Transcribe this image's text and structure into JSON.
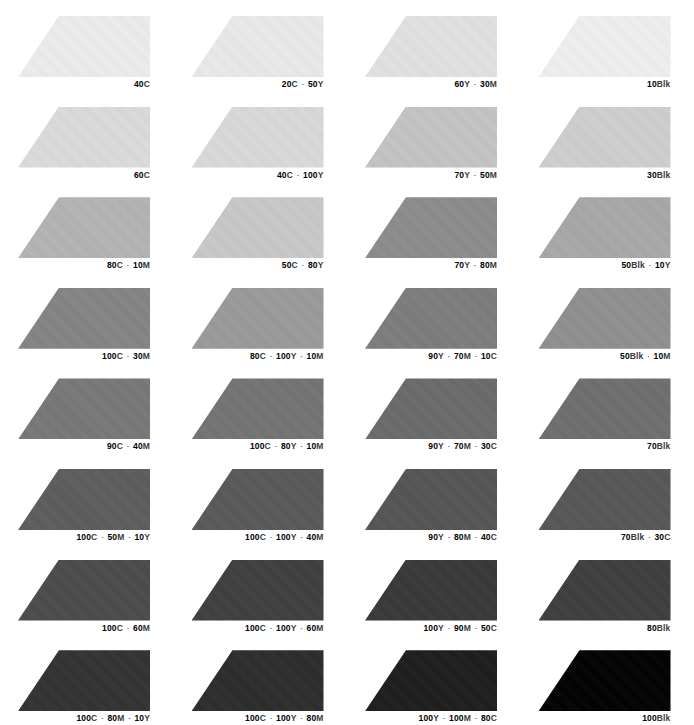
{
  "document": {
    "title": "Process Color Tint Chart",
    "separator": "·",
    "background_color": "#ffffff",
    "label_color": "#000000",
    "columns": 4,
    "rows": 8
  },
  "chart_data": {
    "type": "table",
    "xlabel": "",
    "ylabel": "",
    "legend": [],
    "grid": false,
    "categories": [
      "Column 1",
      "Column 2",
      "Column 3",
      "Column 4"
    ],
    "series": [
      {
        "name": "Row 1",
        "values": [
          {
            "label": "40C",
            "parts": [
              "40C"
            ],
            "swatch_color": "#ededed"
          },
          {
            "label": "20C · 50Y",
            "parts": [
              "20C",
              "50Y"
            ],
            "swatch_color": "#eaeaea"
          },
          {
            "label": "60Y · 30M",
            "parts": [
              "60Y",
              "30M"
            ],
            "swatch_color": "#e2e2e2"
          },
          {
            "label": "10Blk",
            "parts": [
              "10Blk"
            ],
            "swatch_color": "#f0f0f0"
          }
        ]
      },
      {
        "name": "Row 2",
        "values": [
          {
            "label": "60C",
            "parts": [
              "60C"
            ],
            "swatch_color": "#dcdcdc"
          },
          {
            "label": "40C · 100Y",
            "parts": [
              "40C",
              "100Y"
            ],
            "swatch_color": "#dadada"
          },
          {
            "label": "70Y · 50M",
            "parts": [
              "70Y",
              "50M"
            ],
            "swatch_color": "#c4c4c4"
          },
          {
            "label": "30Blk",
            "parts": [
              "30Blk"
            ],
            "swatch_color": "#cfcfcf"
          }
        ]
      },
      {
        "name": "Row 3",
        "values": [
          {
            "label": "80C · 10M",
            "parts": [
              "80C",
              "10M"
            ],
            "swatch_color": "#b4b4b4"
          },
          {
            "label": "50C · 80Y",
            "parts": [
              "50C",
              "80Y"
            ],
            "swatch_color": "#c9c9c9"
          },
          {
            "label": "70Y · 80M",
            "parts": [
              "70Y",
              "80M"
            ],
            "swatch_color": "#8c8c8c"
          },
          {
            "label": "50Blk · 10Y",
            "parts": [
              "50Blk",
              "10Y"
            ],
            "swatch_color": "#a8a8a8"
          }
        ]
      },
      {
        "name": "Row 4",
        "values": [
          {
            "label": "100C · 30M",
            "parts": [
              "100C",
              "30M"
            ],
            "swatch_color": "#848484"
          },
          {
            "label": "80C · 100Y · 10M",
            "parts": [
              "80C",
              "100Y",
              "10M"
            ],
            "swatch_color": "#9a9a9a"
          },
          {
            "label": "90Y · 70M · 10C",
            "parts": [
              "90Y",
              "70M",
              "10C"
            ],
            "swatch_color": "#7c7c7c"
          },
          {
            "label": "50Blk · 10M",
            "parts": [
              "50Blk",
              "10M"
            ],
            "swatch_color": "#8f8f8f"
          }
        ]
      },
      {
        "name": "Row 5",
        "values": [
          {
            "label": "90C · 40M",
            "parts": [
              "90C",
              "40M"
            ],
            "swatch_color": "#777777"
          },
          {
            "label": "100C · 80Y · 10M",
            "parts": [
              "100C",
              "80Y",
              "10M"
            ],
            "swatch_color": "#737373"
          },
          {
            "label": "90Y · 70M · 30C",
            "parts": [
              "90Y",
              "70M",
              "30C"
            ],
            "swatch_color": "#6a6a6a"
          },
          {
            "label": "70Blk",
            "parts": [
              "70Blk"
            ],
            "swatch_color": "#6e6e6e"
          }
        ]
      },
      {
        "name": "Row 6",
        "values": [
          {
            "label": "100C · 50M · 10Y",
            "parts": [
              "100C",
              "50M",
              "10Y"
            ],
            "swatch_color": "#5c5c5c"
          },
          {
            "label": "100C · 100Y · 40M",
            "parts": [
              "100C",
              "100Y",
              "40M"
            ],
            "swatch_color": "#585858"
          },
          {
            "label": "90Y · 80M · 40C",
            "parts": [
              "90Y",
              "80M",
              "40C"
            ],
            "swatch_color": "#545454"
          },
          {
            "label": "70Blk · 30C",
            "parts": [
              "70Blk",
              "30C"
            ],
            "swatch_color": "#565656"
          }
        ]
      },
      {
        "name": "Row 7",
        "values": [
          {
            "label": "100C · 60M",
            "parts": [
              "100C",
              "60M"
            ],
            "swatch_color": "#4a4a4a"
          },
          {
            "label": "100C · 100Y · 60M",
            "parts": [
              "100C",
              "100Y",
              "60M"
            ],
            "swatch_color": "#3e3e3e"
          },
          {
            "label": "100Y · 90M · 50C",
            "parts": [
              "100Y",
              "90M",
              "50C"
            ],
            "swatch_color": "#373737"
          },
          {
            "label": "80Blk",
            "parts": [
              "80Blk"
            ],
            "swatch_color": "#3d3d3d"
          }
        ]
      },
      {
        "name": "Row 8",
        "values": [
          {
            "label": "100C · 80M · 10Y",
            "parts": [
              "100C",
              "80M",
              "10Y"
            ],
            "swatch_color": "#313131"
          },
          {
            "label": "100C · 100Y · 80M",
            "parts": [
              "100C",
              "100Y",
              "80M"
            ],
            "swatch_color": "#2b2b2b"
          },
          {
            "label": "100Y · 100M · 80C",
            "parts": [
              "100Y",
              "100M",
              "80C"
            ],
            "swatch_color": "#1c1c1c"
          },
          {
            "label": "100Blk",
            "parts": [
              "100Blk"
            ],
            "swatch_color": "#000000"
          }
        ]
      }
    ]
  }
}
